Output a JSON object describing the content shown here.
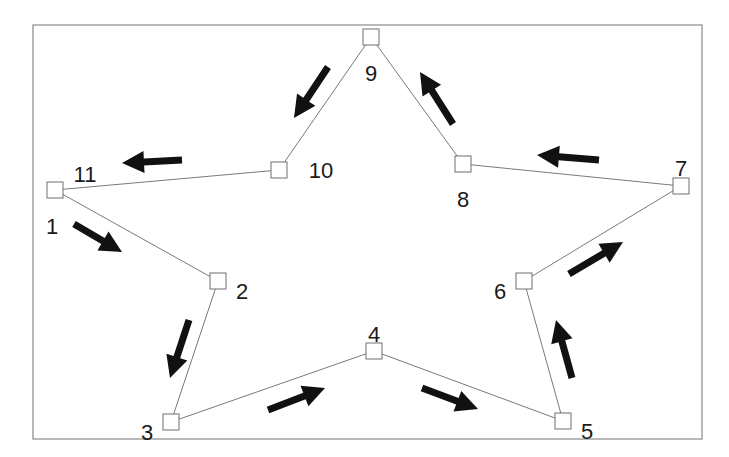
{
  "diagram": {
    "type": "star-polygon-traversal",
    "frame": {
      "x": 33,
      "y": 25,
      "width": 669,
      "height": 414
    },
    "colors": {
      "edge": "#7a7a7a",
      "node_stroke": "#6f6f6f",
      "arrow": "#111111",
      "frame": "#8a8a8a",
      "label": "#1a1a1a"
    },
    "nodes": [
      {
        "id": "1",
        "label": "1",
        "x": 55,
        "y": 190,
        "lx": 52,
        "ly": 226,
        "anchor": "middle"
      },
      {
        "id": "2",
        "label": "2",
        "x": 218,
        "y": 281,
        "lx": 242,
        "ly": 291,
        "anchor": "middle"
      },
      {
        "id": "3",
        "label": "3",
        "x": 171,
        "y": 422,
        "lx": 147,
        "ly": 432,
        "anchor": "middle"
      },
      {
        "id": "4",
        "label": "4",
        "x": 374,
        "y": 351,
        "lx": 374,
        "ly": 334,
        "anchor": "middle"
      },
      {
        "id": "5",
        "label": "5",
        "x": 563,
        "y": 421,
        "lx": 587,
        "ly": 431,
        "anchor": "middle"
      },
      {
        "id": "6",
        "label": "6",
        "x": 524,
        "y": 281,
        "lx": 500,
        "ly": 291,
        "anchor": "middle"
      },
      {
        "id": "7",
        "label": "7",
        "x": 681,
        "y": 186,
        "lx": 681,
        "ly": 168,
        "anchor": "middle"
      },
      {
        "id": "8",
        "label": "8",
        "x": 463,
        "y": 164,
        "lx": 463,
        "ly": 199,
        "anchor": "middle"
      },
      {
        "id": "9",
        "label": "9",
        "x": 371,
        "y": 37,
        "lx": 371,
        "ly": 73,
        "anchor": "middle"
      },
      {
        "id": "10",
        "label": "10",
        "x": 279,
        "y": 170,
        "lx": 321,
        "ly": 170,
        "anchor": "middle"
      }
    ],
    "extra_labels": [
      {
        "id": "11",
        "label": "11",
        "x": 85,
        "y": 174,
        "anchor": "middle",
        "note": "Return to start node (same position as node 1)"
      }
    ],
    "edges": [
      {
        "from": "1",
        "to": "2"
      },
      {
        "from": "2",
        "to": "3"
      },
      {
        "from": "3",
        "to": "4"
      },
      {
        "from": "4",
        "to": "5"
      },
      {
        "from": "5",
        "to": "6"
      },
      {
        "from": "6",
        "to": "7"
      },
      {
        "from": "7",
        "to": "8"
      },
      {
        "from": "8",
        "to": "9"
      },
      {
        "from": "9",
        "to": "10"
      },
      {
        "from": "10",
        "to": "1"
      }
    ],
    "arrows": [
      {
        "name": "arrow-1-to-2",
        "x1": 74,
        "y1": 224,
        "x2": 122,
        "y2": 252
      },
      {
        "name": "arrow-2-to-3",
        "x1": 189,
        "y1": 320,
        "x2": 170,
        "y2": 378
      },
      {
        "name": "arrow-3-to-4",
        "x1": 268,
        "y1": 410,
        "x2": 325,
        "y2": 388
      },
      {
        "name": "arrow-4-to-5",
        "x1": 422,
        "y1": 388,
        "x2": 478,
        "y2": 409
      },
      {
        "name": "arrow-5-to-6",
        "x1": 572,
        "y1": 378,
        "x2": 556,
        "y2": 320
      },
      {
        "name": "arrow-6-to-7",
        "x1": 569,
        "y1": 274,
        "x2": 623,
        "y2": 242
      },
      {
        "name": "arrow-7-to-8",
        "x1": 599,
        "y1": 160,
        "x2": 537,
        "y2": 155
      },
      {
        "name": "arrow-8-to-9",
        "x1": 453,
        "y1": 124,
        "x2": 420,
        "y2": 72
      },
      {
        "name": "arrow-9-to-10",
        "x1": 328,
        "y1": 67,
        "x2": 294,
        "y2": 118
      },
      {
        "name": "arrow-10-to-11",
        "x1": 182,
        "y1": 160,
        "x2": 122,
        "y2": 163
      }
    ]
  }
}
